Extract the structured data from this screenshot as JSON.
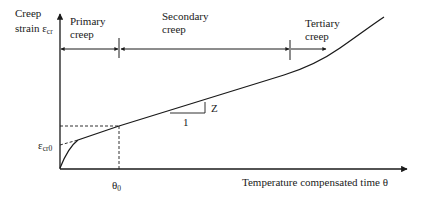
{
  "diagram": {
    "y_axis_label": {
      "line1": "Creep",
      "line2": "strain ε",
      "line2_sub": "cr"
    },
    "x_axis_label": "Temperature compensated time θ",
    "phases": [
      {
        "line1": "Primary",
        "line2": "creep"
      },
      {
        "line1": "Secondary",
        "line2": "creep"
      },
      {
        "line1": "Tertiary",
        "line2": "creep"
      }
    ],
    "markers": {
      "theta0": {
        "main": "θ",
        "sub": "0"
      },
      "eps_cr0": {
        "main": "ε",
        "sub": "cr0"
      }
    },
    "slope_triangle": {
      "run_label": "1",
      "rise_label": "Z"
    },
    "colors": {
      "ink": "#1a1a1a",
      "background": "#ffffff"
    }
  }
}
